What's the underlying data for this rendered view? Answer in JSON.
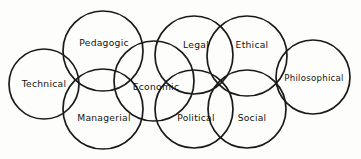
{
  "diagram": {
    "type": "venn-chain",
    "background_color": "#fdfdfb",
    "stroke_color": "#1a1a1a",
    "text_color": "#141414",
    "circles": [
      {
        "id": "technical",
        "label": "Technical",
        "cx": 44,
        "cy": 84,
        "r": 35,
        "label_x": 44,
        "label_y": 84
      },
      {
        "id": "pedagogic",
        "label": "Pedagogic",
        "cx": 103,
        "cy": 51,
        "r": 40,
        "label_x": 104,
        "label_y": 43
      },
      {
        "id": "managerial",
        "label": "Managerial",
        "cx": 103,
        "cy": 109,
        "r": 40,
        "label_x": 104,
        "label_y": 118
      },
      {
        "id": "economic",
        "label": "Economic",
        "cx": 154,
        "cy": 81,
        "r": 40,
        "label_x": 156,
        "label_y": 87
      },
      {
        "id": "legal",
        "label": "Legal",
        "cx": 194,
        "cy": 55,
        "r": 39,
        "label_x": 196,
        "label_y": 45
      },
      {
        "id": "political",
        "label": "Political",
        "cx": 194,
        "cy": 109,
        "r": 39,
        "label_x": 196,
        "label_y": 118
      },
      {
        "id": "ethical",
        "label": "Ethical",
        "cx": 247,
        "cy": 56,
        "r": 40,
        "label_x": 252,
        "label_y": 45
      },
      {
        "id": "social",
        "label": "Social",
        "cx": 247,
        "cy": 109,
        "r": 39,
        "label_x": 252,
        "label_y": 118
      },
      {
        "id": "philosophical",
        "label": "Philosophical",
        "cx": 313,
        "cy": 77,
        "r": 37,
        "label_x": 314,
        "label_y": 78
      }
    ]
  }
}
